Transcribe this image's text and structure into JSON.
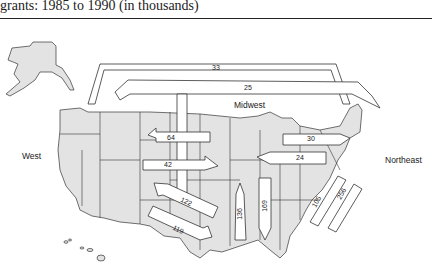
{
  "caption": "grants: 1985 to 1990 (in thousands)",
  "regions": {
    "west": "West",
    "midwest": "Midwest",
    "northeast": "Northeast"
  },
  "colors": {
    "map_fill": "#e3e3e3",
    "arrow_fill": "#ffffff",
    "outline": "#333333"
  },
  "flows": [
    {
      "id": "ne-to-west-top",
      "value": "33"
    },
    {
      "id": "ne-to-west-second",
      "value": "25"
    },
    {
      "id": "mw-to-west-64",
      "value": "64"
    },
    {
      "id": "west-to-mw-42",
      "value": "42"
    },
    {
      "id": "ne-to-mw-30",
      "value": "30"
    },
    {
      "id": "mw-to-ne-24",
      "value": "24"
    },
    {
      "id": "west-to-south-122",
      "value": "122"
    },
    {
      "id": "south-to-west-119",
      "value": "119"
    },
    {
      "id": "south-to-mw-136",
      "value": "136"
    },
    {
      "id": "mw-to-south-169",
      "value": "169"
    },
    {
      "id": "south-to-ne-105",
      "value": "105"
    },
    {
      "id": "ne-to-south-256",
      "value": "256"
    }
  ]
}
